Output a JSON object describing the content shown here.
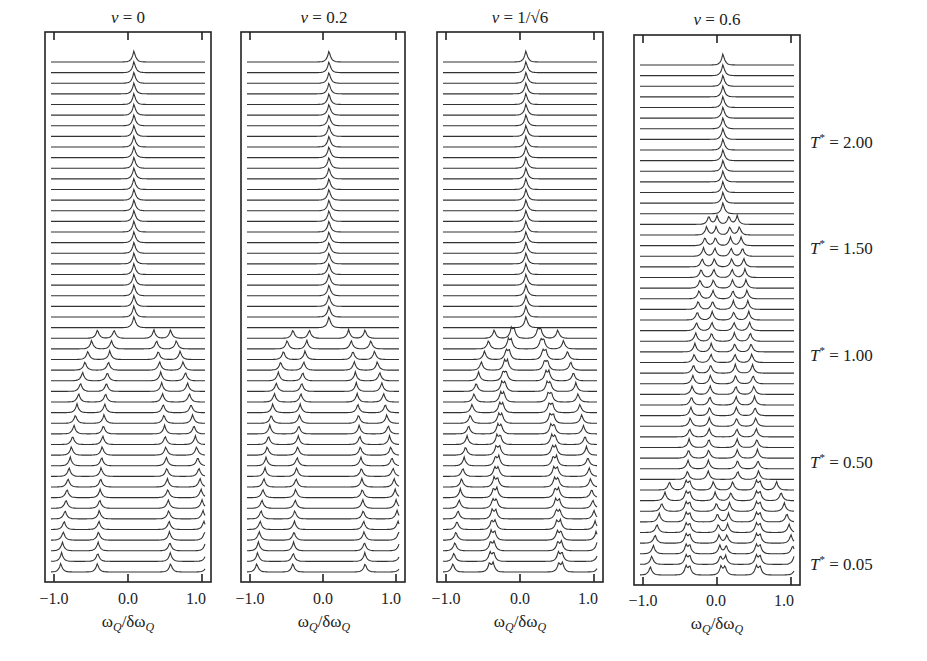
{
  "chart_data": {
    "type": "line",
    "xlabel": "ωQ/δωQ",
    "xlim": [
      -1.15,
      1.15
    ],
    "xticks": [
      -1.0,
      0.0,
      1.0
    ],
    "xtick_labels": [
      "−1.0",
      "0.0",
      "1.0"
    ],
    "n_traces": 49,
    "T_range": [
      0.05,
      2.45
    ],
    "T_step": 0.05,
    "temperature_labels": [
      {
        "text": "2.00",
        "value": 2.0
      },
      {
        "text": "1.50",
        "value": 1.5
      },
      {
        "text": "1.00",
        "value": 1.0
      },
      {
        "text": "0.50",
        "value": 0.5
      },
      {
        "text": "0.05",
        "value": 0.05
      }
    ],
    "panels": [
      {
        "title_prefix": "ν = ",
        "title_value": "0",
        "nu": 0.0,
        "transitions": [
          1.18
        ],
        "low_T_peaks": [
          -1.0,
          -0.5,
          0.5,
          1.0
        ],
        "near_transition_peaks": [
          -0.55,
          -0.25,
          0.25,
          0.55
        ]
      },
      {
        "title_prefix": "ν = ",
        "title_value": "0.2",
        "nu": 0.2,
        "transitions": [
          1.18
        ],
        "low_T_peaks": [
          -1.0,
          -0.5,
          0.5,
          1.0
        ],
        "near_transition_peaks": [
          -0.5,
          -0.2,
          0.2,
          0.5
        ]
      },
      {
        "title_prefix": "ν = ",
        "title_value": "1/√6",
        "nu": 0.408,
        "transitions": [
          1.2
        ],
        "low_T_peaks": [
          -1.0,
          -0.5,
          -0.45,
          0.45,
          0.5,
          1.0
        ],
        "near_transition_peaks": [
          -0.25,
          -0.1,
          0.1,
          0.25
        ]
      },
      {
        "title_prefix": "ν = ",
        "title_value": "0.6",
        "nu": 0.6,
        "transitions": [
          1.75,
          0.5
        ],
        "low_T_peaks": [
          -1.0,
          -0.5,
          -0.45,
          0.45,
          0.5,
          1.0
        ],
        "near_transition_peaks": [
          -0.2,
          -0.1,
          0.1,
          0.2
        ]
      }
    ]
  },
  "axis": {
    "tick_neg": "−1.0",
    "tick_zero": "0.0",
    "tick_pos": "1.0",
    "xlabel_main": "ω",
    "xlabel_sub": "Q",
    "xlabel_slash": "/δω",
    "xlabel_sub2": "Q"
  },
  "titles": {
    "p0": "0",
    "p1": "0.2",
    "p2": "1/√6",
    "p3": "0.6",
    "nu": "ν",
    "eq": " = "
  },
  "tlabels": {
    "symbol": "T",
    "star": "*",
    "eq": " = ",
    "v0": "2.00",
    "v1": "1.50",
    "v2": "1.00",
    "v3": "0.50",
    "v4": "0.05"
  }
}
